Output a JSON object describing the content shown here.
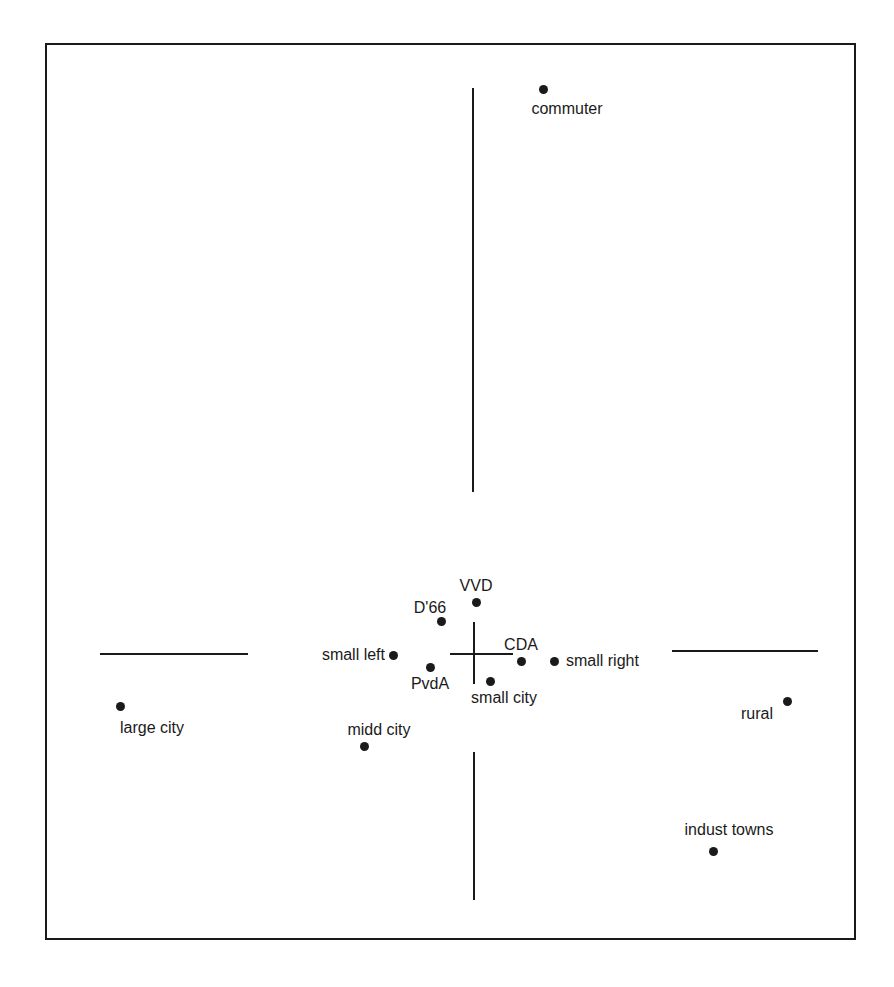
{
  "figure": {
    "background_color": "#ffffff",
    "ink_color": "#1a1a1a",
    "width": 894,
    "height": 987
  },
  "frame": {
    "x": 45,
    "y": 43,
    "width": 811,
    "height": 897
  },
  "axes": {
    "origin_x": 473,
    "origin_y": 653,
    "segments": [
      {
        "name": "vertical-axis-upper",
        "orientation": "vertical",
        "x": 472,
        "y1": 88,
        "y2": 492
      },
      {
        "name": "vertical-axis-lower",
        "orientation": "vertical",
        "x": 473,
        "y1": 752,
        "y2": 900
      },
      {
        "name": "horizontal-axis-left",
        "orientation": "horizontal",
        "y": 653,
        "x1": 100,
        "x2": 248
      },
      {
        "name": "horizontal-axis-right",
        "orientation": "horizontal",
        "y": 650,
        "x1": 672,
        "x2": 818
      },
      {
        "name": "origin-cross-vertical",
        "orientation": "vertical",
        "x": 473,
        "y1": 622,
        "y2": 684
      },
      {
        "name": "origin-cross-horizontal",
        "orientation": "horizontal",
        "y": 653,
        "x1": 450,
        "x2": 513
      }
    ]
  },
  "chart_data": {
    "type": "scatter",
    "title": "",
    "subtitle": "",
    "xlabel": "",
    "ylabel": "",
    "grid": false,
    "legend": null,
    "axis_style": "crossed-axes-through-origin",
    "pixel_origin": {
      "x": 473,
      "y": 653
    },
    "points": [
      {
        "label": "commuter",
        "px": 543,
        "py": 89,
        "label_px": 567,
        "label_py": 109,
        "label_anchor": "center",
        "group": "urbanization",
        "x": 0.36,
        "y": 2.72
      },
      {
        "label": "VVD",
        "px": 476,
        "py": 602,
        "label_px": 476,
        "label_py": 586,
        "label_anchor": "center",
        "group": "party",
        "x": 0.02,
        "y": 0.35
      },
      {
        "label": "D'66",
        "px": 441,
        "py": 621,
        "label_px": 430,
        "label_py": 608,
        "label_anchor": "center",
        "group": "party",
        "x": -0.21,
        "y": 0.22
      },
      {
        "label": "small left",
        "px": 393,
        "py": 655,
        "label_px": 385,
        "label_py": 655,
        "label_anchor": "right",
        "group": "party",
        "x": -0.54,
        "y": -0.01
      },
      {
        "label": "CDA",
        "px": 521,
        "py": 661,
        "label_px": 521,
        "label_py": 645,
        "label_anchor": "center",
        "group": "party",
        "x": 0.32,
        "y": -0.05
      },
      {
        "label": "small right",
        "px": 554,
        "py": 661,
        "label_px": 566,
        "label_py": 661,
        "label_anchor": "left",
        "group": "party",
        "x": 0.55,
        "y": -0.05
      },
      {
        "label": "PvdA",
        "px": 430,
        "py": 667,
        "label_px": 430,
        "label_py": 684,
        "label_anchor": "center",
        "group": "party",
        "x": -0.29,
        "y": -0.09
      },
      {
        "label": "small city",
        "px": 490,
        "py": 681,
        "label_px": 504,
        "label_py": 698,
        "label_anchor": "center",
        "group": "urbanization",
        "x": 0.11,
        "y": -0.19
      },
      {
        "label": "large city",
        "px": 120,
        "py": 706,
        "label_px": 152,
        "label_py": 728,
        "label_anchor": "center",
        "group": "urbanization",
        "x": -2.38,
        "y": -0.36
      },
      {
        "label": "rural",
        "px": 787,
        "py": 701,
        "label_px": 757,
        "label_py": 714,
        "label_anchor": "center",
        "group": "urbanization",
        "x": 2.11,
        "y": -0.32
      },
      {
        "label": "midd city",
        "px": 364,
        "py": 746,
        "label_px": 379,
        "label_py": 730,
        "label_anchor": "center",
        "group": "urbanization",
        "x": -0.73,
        "y": -0.63
      },
      {
        "label": "indust towns",
        "px": 713,
        "py": 851,
        "label_px": 729,
        "label_py": 830,
        "label_anchor": "center",
        "group": "urbanization",
        "x": 1.61,
        "y": -1.33
      }
    ]
  }
}
